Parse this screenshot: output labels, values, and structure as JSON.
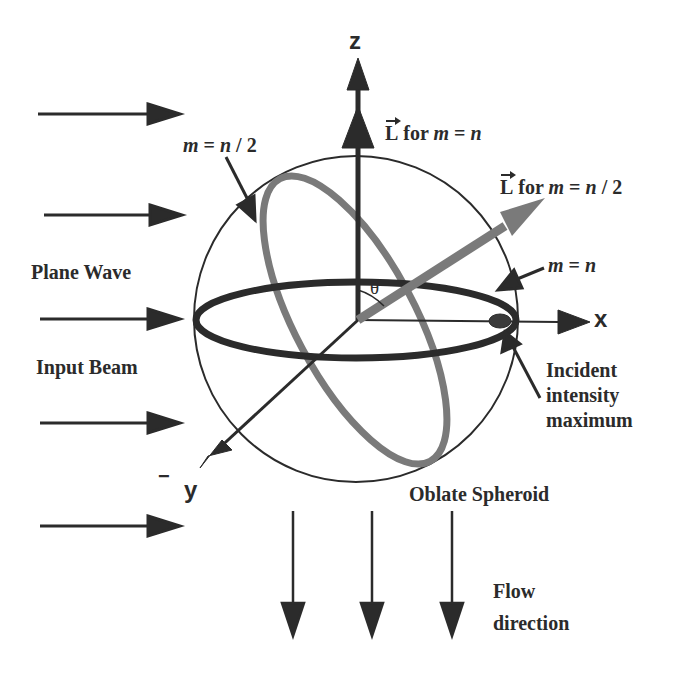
{
  "figure": {
    "axes": {
      "z": "z",
      "x": "x",
      "y": "y",
      "y_sign": "−"
    },
    "angle_label": "θ",
    "labels": {
      "L_vec": "L",
      "L_for_m_eq_n": {
        "prefix": "for",
        "m": "m",
        "eq": " = ",
        "n": "n"
      },
      "L_for_m_eq_n_half": {
        "prefix": "for",
        "m": "m",
        "eq": " = ",
        "n": "n",
        "div": " / 2"
      },
      "m_eq_n_half": {
        "m": "m",
        "eq": " = ",
        "n": "n",
        "div": " / 2"
      },
      "m_eq_n": {
        "m": "m",
        "eq": " = ",
        "n": "n"
      },
      "plane_wave": "Plane Wave",
      "input_beam": "Input Beam",
      "incident_line1": "Incident",
      "incident_line2": "intensity",
      "incident_line3": "maximum",
      "oblate_spheroid": "Oblate Spheroid",
      "flow_line1": "Flow",
      "flow_line2": "direction"
    },
    "colors": {
      "ink": "#2b2b2b",
      "gray_ring": "#7a7a7a",
      "background": "#ffffff"
    },
    "incoming_arrows": 5,
    "flow_arrows": 3
  }
}
